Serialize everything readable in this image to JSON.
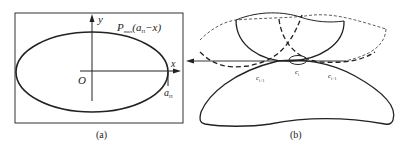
{
  "panel_a": {
    "caption": "(a)",
    "y_axis_label": "y",
    "x_axis_label": "x",
    "origin_label": "O",
    "curve_label_P": "P",
    "curve_label_sub": "max",
    "curve_label_args": "(a",
    "curve_label_args_sub": "H",
    "curve_label_tail": "−x)",
    "a_label": "a",
    "a_label_sub": "H"
  },
  "panel_b": {
    "caption": "(b)",
    "contact_labels": [
      {
        "base": "c",
        "sub": "i+1"
      },
      {
        "base": "c",
        "sub": "i"
      },
      {
        "base": "c",
        "sub": "i−1"
      }
    ]
  },
  "colors": {
    "line": "#222222",
    "background": "#ffffff"
  }
}
